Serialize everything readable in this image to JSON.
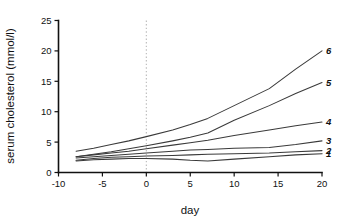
{
  "chart_data": {
    "type": "line",
    "title": "",
    "xlabel": "day",
    "ylabel": "serum cholesterol (mmol/l)",
    "xlim": [
      -10,
      20
    ],
    "ylim": [
      0,
      25
    ],
    "xticks": [
      -10,
      -5,
      0,
      5,
      10,
      15,
      20
    ],
    "yticks": [
      0,
      5,
      10,
      15,
      20,
      25
    ],
    "xtick_labels": [
      "-10",
      "-5",
      "0",
      "5",
      "10",
      "15",
      "20"
    ],
    "ytick_labels": [
      "0",
      "5",
      "10",
      "15",
      "20",
      "25"
    ],
    "grid": false,
    "legend_position": "right-inline-end-labels",
    "annotations": [
      {
        "name": "day-zero-reference",
        "type": "vertical-dashed-line",
        "x": 0,
        "style": "dotted",
        "color": "#b9b9b9"
      }
    ],
    "series": [
      {
        "name": "1",
        "label": "1",
        "color": "#3a3a3a",
        "x": [
          -8,
          -6,
          -4,
          -2,
          0,
          3,
          5,
          7,
          10,
          14,
          17,
          20
        ],
        "values": [
          1.9,
          2.1,
          2.2,
          2.3,
          2.3,
          2.2,
          2.0,
          1.9,
          2.2,
          2.6,
          2.9,
          3.1
        ]
      },
      {
        "name": "2",
        "label": "2",
        "color": "#3a3a3a",
        "x": [
          -8,
          -6,
          -4,
          -2,
          0,
          3,
          5,
          7,
          10,
          14,
          17,
          20
        ],
        "values": [
          2.0,
          2.3,
          2.5,
          2.6,
          2.7,
          2.8,
          2.9,
          3.0,
          3.1,
          3.2,
          3.4,
          3.6
        ]
      },
      {
        "name": "3",
        "label": "3",
        "color": "#3a3a3a",
        "x": [
          -8,
          -6,
          -4,
          -2,
          0,
          3,
          5,
          7,
          10,
          14,
          17,
          20
        ],
        "values": [
          2.4,
          2.6,
          2.8,
          3.0,
          3.2,
          3.5,
          3.7,
          3.8,
          4.0,
          4.1,
          4.6,
          5.2
        ]
      },
      {
        "name": "4",
        "label": "4",
        "color": "#3a3a3a",
        "x": [
          -8,
          -6,
          -4,
          -2,
          0,
          3,
          5,
          7,
          10,
          14,
          17,
          20
        ],
        "values": [
          2.6,
          2.9,
          3.2,
          3.5,
          3.9,
          4.5,
          4.9,
          5.3,
          6.1,
          7.0,
          7.7,
          8.3
        ]
      },
      {
        "name": "5",
        "label": "5",
        "color": "#3a3a3a",
        "x": [
          -8,
          -6,
          -4,
          -2,
          0,
          3,
          5,
          7,
          10,
          14,
          17,
          20
        ],
        "values": [
          2.6,
          3.0,
          3.4,
          3.9,
          4.4,
          5.2,
          5.8,
          6.5,
          8.6,
          11.0,
          13.0,
          14.8
        ]
      },
      {
        "name": "6",
        "label": "6",
        "color": "#3a3a3a",
        "x": [
          -8,
          -6,
          -4,
          -2,
          0,
          3,
          5,
          7,
          10,
          14,
          17,
          20
        ],
        "values": [
          3.5,
          4.0,
          4.6,
          5.2,
          5.9,
          7.0,
          7.9,
          8.9,
          11.0,
          13.8,
          17.0,
          20.0
        ]
      }
    ]
  }
}
